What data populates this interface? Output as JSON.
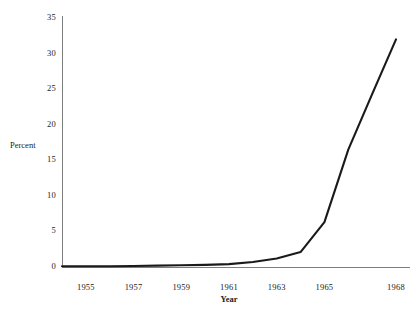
{
  "chart_data": {
    "type": "line",
    "title": "",
    "xlabel": "Year",
    "ylabel": "Percent",
    "xlim": [
      1954,
      1968
    ],
    "ylim": [
      0,
      35
    ],
    "grid": false,
    "legend": false,
    "x_ticks": [
      "1955",
      "1957",
      "1959",
      "1961",
      "1963",
      "1965",
      "1968"
    ],
    "x_tick_values": [
      1955,
      1957,
      1959,
      1961,
      1963,
      1965,
      1968
    ],
    "y_ticks": [
      "0",
      "5",
      "10",
      "15",
      "20",
      "25",
      "30",
      "35"
    ],
    "y_tick_values": [
      0,
      5,
      10,
      15,
      20,
      25,
      30,
      35
    ],
    "series": [
      {
        "name": "Percent",
        "color": "#1a1a1a",
        "x": [
          1954,
          1955,
          1956,
          1957,
          1958,
          1959,
          1960,
          1961,
          1962,
          1963,
          1964,
          1965,
          1966,
          1967,
          1968
        ],
        "values": [
          0.1,
          0.1,
          0.1,
          0.15,
          0.2,
          0.25,
          0.3,
          0.4,
          0.7,
          1.2,
          2.1,
          6.3,
          16.5,
          24.3,
          32.0
        ]
      }
    ]
  },
  "axis": {
    "y_label": "Percent",
    "x_label": "Year"
  },
  "colors": {
    "line": "#1a1a1a",
    "axis": "#7d7d7d",
    "background": "#ffffff",
    "text": "#1c1c1c"
  }
}
